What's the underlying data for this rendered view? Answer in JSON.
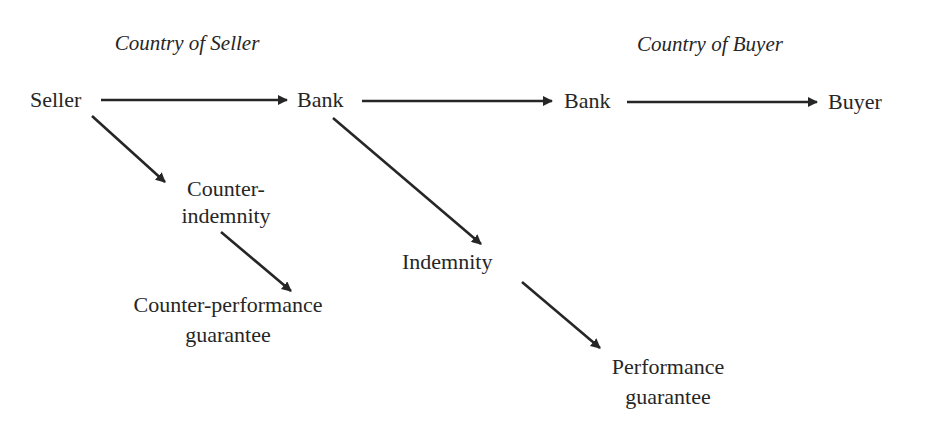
{
  "diagram": {
    "type": "flow",
    "headings": {
      "seller_country": "Country of Seller",
      "buyer_country": "Country of Buyer"
    },
    "nodes": {
      "seller": "Seller",
      "seller_bank": "Bank",
      "buyer_bank": "Bank",
      "buyer": "Buyer",
      "counter_indemnity": [
        "Counter-",
        "indemnity"
      ],
      "counter_performance_guarantee": [
        "Counter-performance",
        "guarantee"
      ],
      "indemnity": "Indemnity",
      "performance_guarantee": [
        "Performance",
        "guarantee"
      ]
    },
    "edges": [
      {
        "from": "Seller",
        "to": "Bank (Country of Seller)"
      },
      {
        "from": "Bank (Country of Seller)",
        "to": "Bank (Country of Buyer)"
      },
      {
        "from": "Bank (Country of Buyer)",
        "to": "Buyer"
      },
      {
        "from": "Seller",
        "to": "Counter-indemnity"
      },
      {
        "from": "Counter-indemnity",
        "to": "Counter-performance guarantee"
      },
      {
        "from": "Bank (Country of Seller)",
        "to": "Indemnity"
      },
      {
        "from": "Indemnity",
        "to": "Performance guarantee"
      }
    ],
    "colors": {
      "ink": "#262626",
      "background": "#ffffff"
    }
  }
}
